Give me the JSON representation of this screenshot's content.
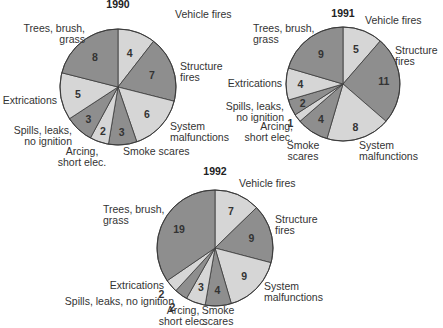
{
  "chart_data": [
    {
      "type": "pie",
      "title": "1990",
      "categories": [
        "Vehicle fires",
        "Structure fires",
        "System malfunctions",
        "Smoke scares",
        "Arcing, short elec.",
        "Spills, leaks, no ignition",
        "Extrications",
        "Trees, brush, grass"
      ],
      "values": [
        4,
        7,
        6,
        3,
        2,
        3,
        5,
        8
      ],
      "labels": [
        [
          "Vehicle fires"
        ],
        [
          "Structure",
          "fires"
        ],
        [
          "System",
          "malfunctions"
        ],
        [
          "Smoke scares"
        ],
        [
          "Arcing,",
          "short elec."
        ],
        [
          "Spills, leaks,",
          "no ignition"
        ],
        [
          "Extrications"
        ],
        [
          "Trees, brush,",
          "grass"
        ]
      ]
    },
    {
      "type": "pie",
      "title": "1991",
      "categories": [
        "Vehicle fires",
        "Structure fires",
        "System malfunctions",
        "Smoke scares",
        "Arcing, short elec.",
        "Spills, leaks, no ignition",
        "Extrications",
        "Trees, brush, grass"
      ],
      "values": [
        5,
        11,
        8,
        4,
        1,
        2,
        4,
        9
      ],
      "labels": [
        [
          "Vehicle fires"
        ],
        [
          "Structure",
          "fires"
        ],
        [
          "System",
          "malfunctions"
        ],
        [
          "Smoke",
          "scares"
        ],
        [
          "Arcing,",
          "short elec."
        ],
        [
          "Spills, leaks,",
          "no ignition"
        ],
        [
          "Extrications"
        ],
        [
          "Trees, brush,",
          "grass"
        ]
      ]
    },
    {
      "type": "pie",
      "title": "1992",
      "categories": [
        "Vehicle fires",
        "Structure fires",
        "System malfunctions",
        "Smoke scares",
        "Arcing, short elec.",
        "Spills, leaks, no ignition",
        "Extrications",
        "Trees, brush, grass"
      ],
      "values": [
        7,
        9,
        9,
        4,
        3,
        2,
        2,
        19
      ],
      "labels": [
        [
          "Vehicle fires"
        ],
        [
          "Structure",
          "fires"
        ],
        [
          "System",
          "malfunctions"
        ],
        [
          "Smoke",
          "scares"
        ],
        [
          "Arcing,",
          "short elec."
        ],
        [
          "Spills, leaks, no ignition"
        ],
        [
          "Extrications"
        ],
        [
          "Trees, brush,",
          "grass"
        ]
      ]
    }
  ],
  "colors": {
    "light": "#d6d6d6",
    "dark": "#8e8e8e",
    "stroke": "#3a3a3a"
  }
}
